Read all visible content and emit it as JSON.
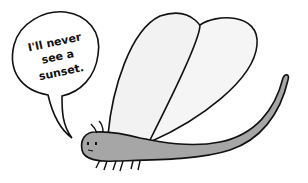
{
  "comic": {
    "speech_bubble": {
      "lines": [
        "I'll never",
        "see a",
        "sunset."
      ]
    },
    "character": "mayfly",
    "colors": {
      "body": "#a6a6a6",
      "wing": "#f0f0f0",
      "outline": "#111111",
      "background": "#ffffff"
    }
  }
}
